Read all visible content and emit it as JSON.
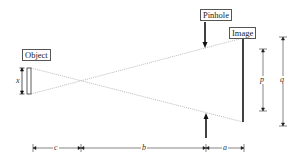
{
  "diagram": {
    "labels": {
      "object": "Object",
      "pinhole": "Pinhole",
      "image": "Image"
    },
    "variables": {
      "object_height": "x",
      "pinhole_half_height": "p",
      "image_height": "q",
      "object_to_crossing": "c",
      "crossing_to_pinhole": "b",
      "pinhole_to_image": "a"
    },
    "colors": {
      "line": "#111111",
      "ray": "#aaaaaa",
      "text": "#222222"
    }
  }
}
